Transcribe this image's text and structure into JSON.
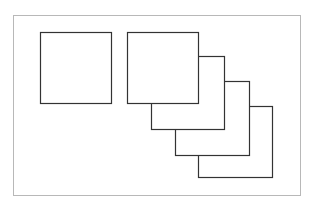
{
  "figure": {
    "frame": {
      "x": 13,
      "y": 15,
      "w": 288,
      "h": 181,
      "color": "#b8b8b8"
    },
    "single_square": {
      "x": 40,
      "y": 32,
      "w": 71,
      "h": 71
    },
    "stacked_squares": [
      {
        "x": 198,
        "y": 106,
        "w": 74,
        "h": 71
      },
      {
        "x": 175,
        "y": 81,
        "w": 74,
        "h": 74
      },
      {
        "x": 151,
        "y": 56,
        "w": 73,
        "h": 73
      },
      {
        "x": 127,
        "y": 32,
        "w": 71,
        "h": 71
      }
    ],
    "stroke_color": "#333333"
  }
}
